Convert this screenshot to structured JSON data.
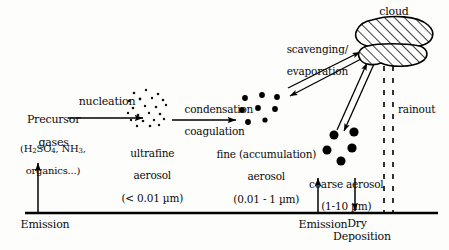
{
  "figure": {
    "type": "process-diagram",
    "background_color": "#fdfdfb",
    "ink_color": "#000000"
  },
  "nodes": {
    "precursor": {
      "line1": "Precursor",
      "line2": "gases",
      "formula_pre": "(H",
      "formula_sub1": "2",
      "formula_mid": "SO",
      "formula_sub2": "4",
      "formula_mid2": ", NH",
      "formula_sub3": "3",
      "formula_tail": ",",
      "line4": "organics...)"
    },
    "ultrafine": {
      "line1": "ultrafine",
      "line2": "aerosol",
      "line3": "(< 0.01 µm)",
      "dot_count": 22,
      "dot_size_px": 1.3
    },
    "fine": {
      "line1": "fine (accumulation)",
      "line2": "aerosol",
      "line3": "(0.01 - 1 µm)",
      "dot_count": 8,
      "dot_size_px": 3.0
    },
    "coarse": {
      "line1": "coarse aerosol",
      "line2": "(1-10 µm)",
      "dot_count": 5,
      "dot_size_px": 4.6
    },
    "cloud": {
      "label": "cloud",
      "fill": "diagonal-hatch"
    }
  },
  "process_labels": {
    "nucleation": "nucleation",
    "condensation": "condensation",
    "coagulation": "coagulation",
    "scavenging": "scavenging/",
    "evaporation": "evaporation",
    "rainout": "rainout",
    "emission_left": "Emission",
    "emission_right": "Emission",
    "dry": "Dry",
    "deposition": "Deposition"
  },
  "ground": {
    "y": 213,
    "x_start": 25,
    "x_end": 438
  }
}
